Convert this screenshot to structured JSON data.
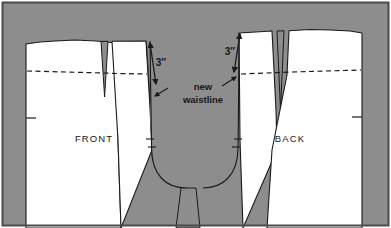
{
  "figure": {
    "background_color": "#8d8d8d",
    "piece_fill_color": "#ffffff",
    "outline_color": "#1a1a1a",
    "border_color": "#4a4a4a",
    "frame": {
      "x": 2,
      "y": 2,
      "width": 387,
      "height": 224
    },
    "labels": {
      "front": "FRONT",
      "back": "BACK",
      "measurement_left": "3″",
      "measurement_right": "3″",
      "note_line1": "new",
      "note_line2": "waistline"
    },
    "annotations": [
      {
        "name": "left-drop-dimension",
        "value": "3″",
        "meaning": "vertical drop from original waist to new waistline at front center"
      },
      {
        "name": "right-drop-dimension",
        "value": "3″",
        "meaning": "vertical drop from original waist to new waistline at back center"
      },
      {
        "name": "new-waistline-callout",
        "value": "new waistline",
        "meaning": "dashed line across both pattern pieces marking the lowered waist"
      }
    ],
    "elements": {
      "front_piece_label_position": "left",
      "back_piece_label_position": "right",
      "waistline_style": "dashed",
      "crotch_region_style": "filled-background",
      "dart_count_front": 1,
      "dart_count_back": 1,
      "notch_count": 2
    }
  }
}
